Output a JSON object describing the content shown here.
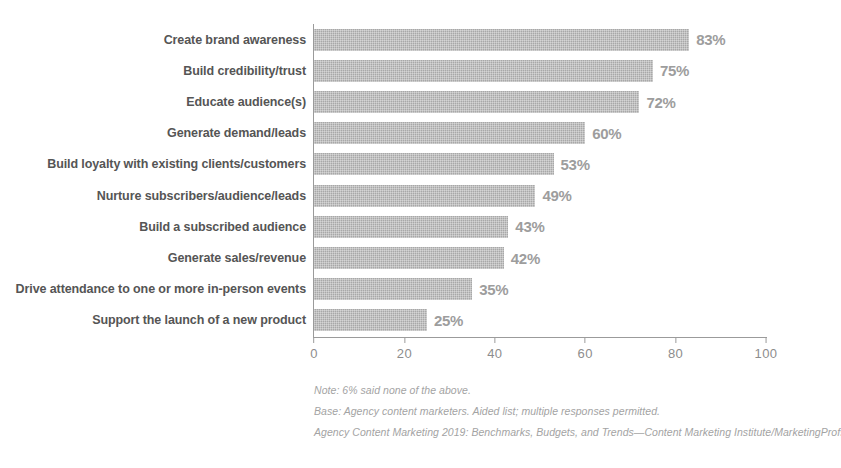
{
  "chart_data": {
    "type": "bar",
    "orientation": "horizontal",
    "title": "",
    "xlabel": "",
    "ylabel": "",
    "xlim": [
      0,
      100
    ],
    "xticks": [
      "0",
      "20",
      "40",
      "60",
      "80",
      "100"
    ],
    "grid": false,
    "legend": false,
    "bar_color": "#a8a8a8",
    "value_suffix": "%",
    "categories": [
      "Create brand awareness",
      "Build credibility/trust",
      "Educate audience(s)",
      "Generate demand/leads",
      "Build loyalty with existing clients/customers",
      "Nurture subscribers/audience/leads",
      "Build a subscribed audience",
      "Generate sales/revenue",
      "Drive attendance to one or more in-person events",
      "Support the launch of a new product"
    ],
    "values": [
      83,
      75,
      72,
      60,
      53,
      49,
      43,
      42,
      35,
      25
    ],
    "value_labels": [
      "83%",
      "75%",
      "72%",
      "60%",
      "53%",
      "49%",
      "43%",
      "42%",
      "35%",
      "25%"
    ]
  },
  "title_remnant": "",
  "footnotes": [
    "Note: 6% said none of the above.",
    "Base: Agency content marketers. Aided list; multiple responses permitted.",
    "Agency Content Marketing 2019: Benchmarks, Budgets, and Trends—Content Marketing Institute/MarketingProfs"
  ]
}
